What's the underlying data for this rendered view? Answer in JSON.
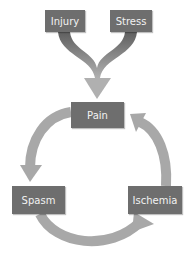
{
  "diagram": {
    "title": "",
    "nodes": {
      "injury": "Injury",
      "stress": "Stress",
      "pain": "Pain",
      "spasm": "Spasm",
      "ischemia": "Ischemia"
    },
    "edges": [
      {
        "from": "Injury",
        "to": "Pain"
      },
      {
        "from": "Stress",
        "to": "Pain"
      },
      {
        "from": "Pain",
        "to": "Spasm"
      },
      {
        "from": "Spasm",
        "to": "Ischemia"
      },
      {
        "from": "Ischemia",
        "to": "Pain"
      }
    ],
    "colors": {
      "box_fill": "#6e6e6e",
      "box_text": "#f2f2f2",
      "arrow_dark": "#6a6a6a",
      "arrow_light": "#a8a8a8"
    }
  }
}
